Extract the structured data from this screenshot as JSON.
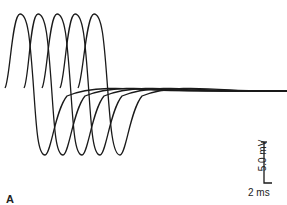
{
  "chart_data": {
    "type": "line",
    "title": "",
    "xlabel": "",
    "ylabel": "",
    "grid": false,
    "legend": null,
    "series": [
      {
        "name": "trace-1",
        "start_x": 5,
        "peak_x": 20,
        "trough_x": 45
      },
      {
        "name": "trace-2",
        "start_x": 24,
        "peak_x": 38,
        "trough_x": 63
      },
      {
        "name": "trace-3",
        "start_x": 42,
        "peak_x": 57,
        "trough_x": 82
      },
      {
        "name": "trace-4",
        "start_x": 60,
        "peak_x": 75,
        "trough_x": 100
      },
      {
        "name": "trace-5",
        "start_x": 78,
        "peak_x": 94,
        "trough_x": 120
      }
    ],
    "scale_bar": {
      "vertical_label": "5.0 mV",
      "horizontal_label": "2 ms"
    },
    "annotations": [
      "5.0 mV",
      "2 ms",
      "A"
    ]
  },
  "labels": {
    "scale_v": "5.0 mV",
    "scale_h": "2 ms",
    "panel": "A"
  },
  "colors": {
    "trace": "#1a1a1a",
    "background": "#ffffff"
  }
}
